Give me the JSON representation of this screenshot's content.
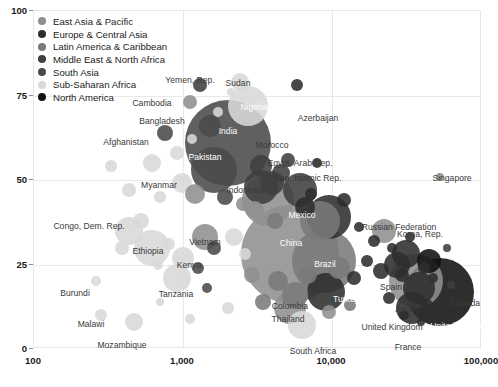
{
  "chart_data": {
    "type": "scatter",
    "title": "",
    "xlabel": "",
    "ylabel": "",
    "xscale": "log",
    "yscale": "linear",
    "xlim": [
      100,
      100000
    ],
    "ylim": [
      0,
      100
    ],
    "xticks": [
      "100",
      "1,000",
      "10,000",
      "100,000"
    ],
    "xtick_values": [
      100,
      1000,
      10000,
      100000
    ],
    "yticks": [
      "0",
      "25",
      "50",
      "75",
      "100"
    ],
    "ytick_values": [
      0,
      25,
      50,
      75,
      100
    ],
    "grid": true,
    "legend_position": "top-left",
    "size_encodes": "population",
    "color_encodes": "region",
    "series": [
      {
        "name": "East Asia & Pacific",
        "color": "#8f8f8f"
      },
      {
        "name": "Europe & Central Asia",
        "color": "#2e2e2e"
      },
      {
        "name": "Latin America & Caribbean",
        "color": "#7a7a7a"
      },
      {
        "name": "Middle East & North Africa",
        "color": "#3f3f3f"
      },
      {
        "name": "South Asia",
        "color": "#4a4a4a"
      },
      {
        "name": "Sub-Saharan Africa",
        "color": "#d8d8d8"
      },
      {
        "name": "North America",
        "color": "#111111"
      }
    ],
    "points": [
      {
        "label": "Yemen, Rep.",
        "x": 1300,
        "y": 78,
        "r": 7,
        "region": "Middle East & North Africa",
        "lx": 190,
        "ly": 80,
        "anchor": "center"
      },
      {
        "label": "Sudan",
        "x": 2400,
        "y": 79,
        "r": 9,
        "region": "Sub-Saharan Africa",
        "lx": 238,
        "ly": 83,
        "anchor": "center"
      },
      {
        "label": "Nigeria",
        "x": 2700,
        "y": 72,
        "r": 20,
        "region": "Sub-Saharan Africa",
        "lx": 254,
        "ly": 107,
        "anchor": "center",
        "light": true
      },
      {
        "label": "Cambodia",
        "x": 1100,
        "y": 73,
        "r": 7,
        "region": "East Asia & Pacific",
        "lx": 152,
        "ly": 103,
        "anchor": "center"
      },
      {
        "label": "Bangladesh",
        "x": 1500,
        "y": 66,
        "r": 11,
        "region": "South Asia",
        "lx": 162,
        "ly": 121,
        "anchor": "center"
      },
      {
        "label": "India",
        "x": 2000,
        "y": 61,
        "r": 43,
        "region": "South Asia",
        "lx": 228,
        "ly": 131,
        "anchor": "center",
        "light": true
      },
      {
        "label": "Azerbaijan",
        "x": 5800,
        "y": 78,
        "r": 6,
        "region": "Europe & Central Asia",
        "lx": 318,
        "ly": 118,
        "anchor": "center"
      },
      {
        "label": "Afghanistan",
        "x": 750,
        "y": 64,
        "r": 8,
        "region": "South Asia",
        "lx": 126,
        "ly": 142,
        "anchor": "center"
      },
      {
        "label": "Pakistan",
        "x": 1600,
        "y": 53,
        "r": 23,
        "region": "South Asia",
        "lx": 205,
        "ly": 157,
        "anchor": "center",
        "light": true
      },
      {
        "label": "Morocco",
        "x": 3300,
        "y": 54,
        "r": 11,
        "region": "Middle East & North Africa",
        "lx": 272,
        "ly": 145,
        "anchor": "center"
      },
      {
        "label": "Egypt, Arab Rep.",
        "x": 3300,
        "y": 48,
        "r": 17,
        "region": "Middle East & North Africa",
        "lx": 300,
        "ly": 163,
        "anchor": "center"
      },
      {
        "label": "Iran, Islamic Rep.",
        "x": 6000,
        "y": 47,
        "r": 17,
        "region": "Middle East & North Africa",
        "lx": 308,
        "ly": 178,
        "anchor": "center"
      },
      {
        "label": "Singapore",
        "x": 52000,
        "y": 51,
        "r": 4,
        "region": "East Asia & Pacific",
        "lx": 452,
        "ly": 178,
        "anchor": "center"
      },
      {
        "label": "Myanmar",
        "x": 1200,
        "y": 46,
        "r": 10,
        "region": "East Asia & Pacific",
        "lx": 159,
        "ly": 185,
        "anchor": "center"
      },
      {
        "label": "Indonesia",
        "x": 3700,
        "y": 44,
        "r": 26,
        "region": "East Asia & Pacific",
        "lx": 245,
        "ly": 190,
        "anchor": "center"
      },
      {
        "label": "Russian Federation",
        "x": 9500,
        "y": 39,
        "r": 22,
        "region": "Europe & Central Asia",
        "lx": 399,
        "ly": 227,
        "anchor": "center"
      },
      {
        "label": "Congo, Dem. Rep.",
        "x": 430,
        "y": 35,
        "r": 14,
        "region": "Sub-Saharan Africa",
        "lx": 89,
        "ly": 226,
        "anchor": "center"
      },
      {
        "label": "Mexico",
        "x": 8200,
        "y": 38,
        "r": 20,
        "region": "Latin America & Caribbean",
        "lx": 302,
        "ly": 215,
        "anchor": "center",
        "light": true
      },
      {
        "label": "Korea, Rep.",
        "x": 22000,
        "y": 35,
        "r": 12,
        "region": "East Asia & Pacific",
        "lx": 420,
        "ly": 234,
        "anchor": "center"
      },
      {
        "label": "Vietnam",
        "x": 1400,
        "y": 33,
        "r": 13,
        "region": "East Asia & Pacific",
        "lx": 205,
        "ly": 242,
        "anchor": "center"
      },
      {
        "label": "Ethiopia",
        "x": 620,
        "y": 30,
        "r": 18,
        "region": "Sub-Saharan Africa",
        "lx": 148,
        "ly": 251,
        "anchor": "center"
      },
      {
        "label": "China",
        "x": 5200,
        "y": 28,
        "r": 49,
        "region": "East Asia & Pacific",
        "lx": 291,
        "ly": 243,
        "anchor": "center",
        "light": true
      },
      {
        "label": "Brazil",
        "x": 8800,
        "y": 26,
        "r": 32,
        "region": "Latin America & Caribbean",
        "lx": 325,
        "ly": 264,
        "anchor": "center",
        "light": true
      },
      {
        "label": "Kenya",
        "x": 1000,
        "y": 27,
        "r": 11,
        "region": "Sub-Saharan Africa",
        "lx": 189,
        "ly": 265,
        "anchor": "center"
      },
      {
        "label": "Italy",
        "x": 31000,
        "y": 28,
        "r": 14,
        "region": "Europe & Central Asia",
        "lx": 429,
        "ly": 279,
        "anchor": "center"
      },
      {
        "label": "Spain",
        "x": 27000,
        "y": 25,
        "r": 13,
        "region": "Europe & Central Asia",
        "lx": 391,
        "ly": 287,
        "anchor": "center"
      },
      {
        "label": "Burundi",
        "x": 260,
        "y": 20,
        "r": 5,
        "region": "Sub-Saharan Africa",
        "lx": 75,
        "ly": 293,
        "anchor": "center"
      },
      {
        "label": "Tanzania",
        "x": 900,
        "y": 21,
        "r": 14,
        "region": "Sub-Saharan Africa",
        "lx": 176,
        "ly": 294,
        "anchor": "center"
      },
      {
        "label": "Canada",
        "x": 44000,
        "y": 26,
        "r": 12,
        "region": "North America",
        "lx": 465,
        "ly": 303,
        "anchor": "center"
      },
      {
        "label": "Japan",
        "x": 36000,
        "y": 20,
        "r": 27,
        "region": "East Asia & Pacific",
        "lx": 407,
        "ly": 309,
        "anchor": "center"
      },
      {
        "label": "Colombia",
        "x": 5600,
        "y": 16,
        "r": 13,
        "region": "Latin America & Caribbean",
        "lx": 290,
        "ly": 306,
        "anchor": "center"
      },
      {
        "label": "Turkey",
        "x": 9000,
        "y": 17,
        "r": 19,
        "region": "Europe & Central Asia",
        "lx": 346,
        "ly": 299,
        "anchor": "center",
        "light": true
      },
      {
        "label": "United States",
        "x": 52000,
        "y": 17,
        "r": 34,
        "region": "North America",
        "lx": 456,
        "ly": 326,
        "anchor": "center",
        "light": true
      },
      {
        "label": "United Kingdom",
        "x": 38000,
        "y": 18,
        "r": 16,
        "region": "Europe & Central Asia",
        "lx": 392,
        "ly": 327,
        "anchor": "center"
      },
      {
        "label": "Malawi",
        "x": 280,
        "y": 10,
        "r": 6,
        "region": "Sub-Saharan Africa",
        "lx": 91,
        "ly": 324,
        "anchor": "center"
      },
      {
        "label": "Thailand",
        "x": 5200,
        "y": 12,
        "r": 16,
        "region": "East Asia & Pacific",
        "lx": 288,
        "ly": 319,
        "anchor": "center"
      },
      {
        "label": "France",
        "x": 34000,
        "y": 12,
        "r": 16,
        "region": "Europe & Central Asia",
        "lx": 408,
        "ly": 347,
        "anchor": "center"
      },
      {
        "label": "Mozambique",
        "x": 470,
        "y": 8,
        "r": 9,
        "region": "Sub-Saharan Africa",
        "lx": 122,
        "ly": 345,
        "anchor": "center"
      },
      {
        "label": "South Africa",
        "x": 6200,
        "y": 7,
        "r": 14,
        "region": "Sub-Saharan Africa",
        "lx": 313,
        "ly": 351,
        "anchor": "center"
      }
    ],
    "unlabeled_points": [
      {
        "x": 330,
        "y": 54,
        "r": 6,
        "region": "Sub-Saharan Africa"
      },
      {
        "x": 620,
        "y": 55,
        "r": 9,
        "region": "Sub-Saharan Africa"
      },
      {
        "x": 900,
        "y": 58,
        "r": 7,
        "region": "Sub-Saharan Africa"
      },
      {
        "x": 1150,
        "y": 62,
        "r": 5,
        "region": "Sub-Saharan Africa"
      },
      {
        "x": 430,
        "y": 47,
        "r": 7,
        "region": "Sub-Saharan Africa"
      },
      {
        "x": 700,
        "y": 45,
        "r": 6,
        "region": "Sub-Saharan Africa"
      },
      {
        "x": 980,
        "y": 49,
        "r": 10,
        "region": "Sub-Saharan Africa"
      },
      {
        "x": 1700,
        "y": 70,
        "r": 5,
        "region": "Sub-Saharan Africa"
      },
      {
        "x": 2100,
        "y": 76,
        "r": 4,
        "region": "Sub-Saharan Africa"
      },
      {
        "x": 1900,
        "y": 45,
        "r": 8,
        "region": "South Asia"
      },
      {
        "x": 2500,
        "y": 43,
        "r": 7,
        "region": "East Asia & Pacific"
      },
      {
        "x": 3000,
        "y": 41,
        "r": 9,
        "region": "East Asia & Pacific"
      },
      {
        "x": 3900,
        "y": 49,
        "r": 12,
        "region": "Middle East & North Africa"
      },
      {
        "x": 4500,
        "y": 52,
        "r": 9,
        "region": "Middle East & North Africa"
      },
      {
        "x": 4100,
        "y": 38,
        "r": 8,
        "region": "Latin America & Caribbean"
      },
      {
        "x": 6500,
        "y": 42,
        "r": 10,
        "region": "Europe & Central Asia"
      },
      {
        "x": 7200,
        "y": 46,
        "r": 6,
        "region": "Europe & Central Asia"
      },
      {
        "x": 12000,
        "y": 44,
        "r": 7,
        "region": "Europe & Central Asia"
      },
      {
        "x": 15000,
        "y": 36,
        "r": 5,
        "region": "Europe & Central Asia"
      },
      {
        "x": 19000,
        "y": 32,
        "r": 6,
        "region": "Europe & Central Asia"
      },
      {
        "x": 25000,
        "y": 30,
        "r": 5,
        "region": "Europe & Central Asia"
      },
      {
        "x": 33000,
        "y": 33,
        "r": 5,
        "region": "Europe & Central Asia"
      },
      {
        "x": 2200,
        "y": 33,
        "r": 9,
        "region": "Sub-Saharan Africa"
      },
      {
        "x": 1600,
        "y": 30,
        "r": 7,
        "region": "South Asia"
      },
      {
        "x": 800,
        "y": 31,
        "r": 6,
        "region": "Sub-Saharan Africa"
      },
      {
        "x": 520,
        "y": 38,
        "r": 8,
        "region": "Sub-Saharan Africa"
      },
      {
        "x": 390,
        "y": 30,
        "r": 7,
        "region": "Sub-Saharan Africa"
      },
      {
        "x": 680,
        "y": 25,
        "r": 5,
        "region": "Sub-Saharan Africa"
      },
      {
        "x": 1250,
        "y": 24,
        "r": 6,
        "region": "South Asia"
      },
      {
        "x": 2900,
        "y": 22,
        "r": 8,
        "region": "East Asia & Pacific"
      },
      {
        "x": 4300,
        "y": 20,
        "r": 10,
        "region": "Latin America & Caribbean"
      },
      {
        "x": 6800,
        "y": 22,
        "r": 9,
        "region": "Latin America & Caribbean"
      },
      {
        "x": 11000,
        "y": 24,
        "r": 11,
        "region": "Latin America & Caribbean"
      },
      {
        "x": 14000,
        "y": 21,
        "r": 7,
        "region": "Europe & Central Asia"
      },
      {
        "x": 17000,
        "y": 26,
        "r": 6,
        "region": "Europe & Central Asia"
      },
      {
        "x": 21000,
        "y": 23,
        "r": 8,
        "region": "Europe & Central Asia"
      },
      {
        "x": 29000,
        "y": 22,
        "r": 7,
        "region": "Europe & Central Asia"
      },
      {
        "x": 41000,
        "y": 24,
        "r": 6,
        "region": "Europe & Central Asia"
      },
      {
        "x": 47000,
        "y": 21,
        "r": 5,
        "region": "Europe & Central Asia"
      },
      {
        "x": 3400,
        "y": 14,
        "r": 8,
        "region": "Latin America & Caribbean"
      },
      {
        "x": 2000,
        "y": 12,
        "r": 6,
        "region": "Sub-Saharan Africa"
      },
      {
        "x": 1100,
        "y": 9,
        "r": 5,
        "region": "Sub-Saharan Africa"
      },
      {
        "x": 700,
        "y": 14,
        "r": 4,
        "region": "Sub-Saharan Africa"
      },
      {
        "x": 9500,
        "y": 11,
        "r": 7,
        "region": "East Asia & Pacific"
      },
      {
        "x": 13000,
        "y": 13,
        "r": 6,
        "region": "Latin America & Caribbean"
      },
      {
        "x": 24000,
        "y": 15,
        "r": 6,
        "region": "Europe & Central Asia"
      },
      {
        "x": 30000,
        "y": 10,
        "r": 5,
        "region": "Europe & Central Asia"
      },
      {
        "x": 43000,
        "y": 13,
        "r": 6,
        "region": "Europe & Central Asia"
      },
      {
        "x": 39000,
        "y": 8,
        "r": 4,
        "region": "Europe & Central Asia"
      },
      {
        "x": 58000,
        "y": 30,
        "r": 4,
        "region": "Middle East & North Africa"
      },
      {
        "x": 62000,
        "y": 19,
        "r": 4,
        "region": "Middle East & North Africa"
      },
      {
        "x": 1450,
        "y": 18,
        "r": 5,
        "region": "South Asia"
      },
      {
        "x": 2600,
        "y": 28,
        "r": 6,
        "region": "Sub-Saharan Africa"
      },
      {
        "x": 5000,
        "y": 56,
        "r": 7,
        "region": "Middle East & North Africa"
      },
      {
        "x": 7800,
        "y": 55,
        "r": 5,
        "region": "Europe & Central Asia"
      }
    ]
  }
}
